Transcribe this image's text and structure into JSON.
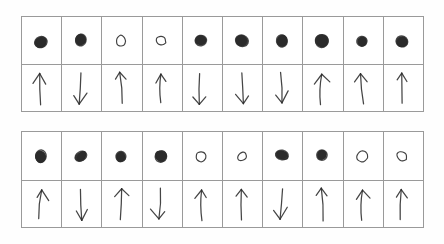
{
  "page": {
    "background_color": "#fdfdfd",
    "ink_color": "#2b2b2b",
    "grid_line_color": "#9a9a9a",
    "columns": 10,
    "tables": 2
  },
  "legend": {
    "filled_dot_label": "filled-dot",
    "open_dot_label": "open-dot",
    "arrow_up_label": "arrow-up",
    "arrow_down_label": "arrow-down"
  },
  "tables": [
    {
      "name": "top-grid",
      "rows": [
        {
          "name": "dot-row",
          "type": "dot",
          "cells": [
            {
              "value": "filled",
              "label": "filled-dot"
            },
            {
              "value": "filled",
              "label": "filled-dot"
            },
            {
              "value": "open",
              "label": "open-dot"
            },
            {
              "value": "open",
              "label": "open-dot"
            },
            {
              "value": "filled",
              "label": "filled-dot"
            },
            {
              "value": "filled",
              "label": "filled-dot"
            },
            {
              "value": "filled",
              "label": "filled-dot"
            },
            {
              "value": "filled",
              "label": "filled-dot"
            },
            {
              "value": "filled",
              "label": "filled-dot"
            },
            {
              "value": "filled",
              "label": "filled-dot"
            }
          ]
        },
        {
          "name": "arrow-row",
          "type": "arrow",
          "cells": [
            {
              "value": "up",
              "label": "arrow-up"
            },
            {
              "value": "down",
              "label": "arrow-down"
            },
            {
              "value": "up",
              "label": "arrow-up"
            },
            {
              "value": "up",
              "label": "arrow-up"
            },
            {
              "value": "down",
              "label": "arrow-down"
            },
            {
              "value": "down",
              "label": "arrow-down"
            },
            {
              "value": "down",
              "label": "arrow-down"
            },
            {
              "value": "up",
              "label": "arrow-up"
            },
            {
              "value": "up",
              "label": "arrow-up"
            },
            {
              "value": "up",
              "label": "arrow-up"
            }
          ]
        }
      ]
    },
    {
      "name": "bottom-grid",
      "rows": [
        {
          "name": "dot-row",
          "type": "dot",
          "cells": [
            {
              "value": "filled",
              "label": "filled-dot"
            },
            {
              "value": "filled",
              "label": "filled-dot"
            },
            {
              "value": "filled",
              "label": "filled-dot"
            },
            {
              "value": "filled",
              "label": "filled-dot"
            },
            {
              "value": "open",
              "label": "open-dot"
            },
            {
              "value": "open",
              "label": "open-dot"
            },
            {
              "value": "filled",
              "label": "filled-dot"
            },
            {
              "value": "filled",
              "label": "filled-dot"
            },
            {
              "value": "open",
              "label": "open-dot"
            },
            {
              "value": "open",
              "label": "open-dot"
            }
          ]
        },
        {
          "name": "arrow-row",
          "type": "arrow",
          "cells": [
            {
              "value": "up",
              "label": "arrow-up"
            },
            {
              "value": "down",
              "label": "arrow-down"
            },
            {
              "value": "up",
              "label": "arrow-up"
            },
            {
              "value": "down",
              "label": "arrow-down"
            },
            {
              "value": "up",
              "label": "arrow-up"
            },
            {
              "value": "up",
              "label": "arrow-up"
            },
            {
              "value": "down",
              "label": "arrow-down"
            },
            {
              "value": "up",
              "label": "arrow-up"
            },
            {
              "value": "up",
              "label": "arrow-up"
            },
            {
              "value": "up",
              "label": "arrow-up"
            }
          ]
        }
      ]
    }
  ]
}
